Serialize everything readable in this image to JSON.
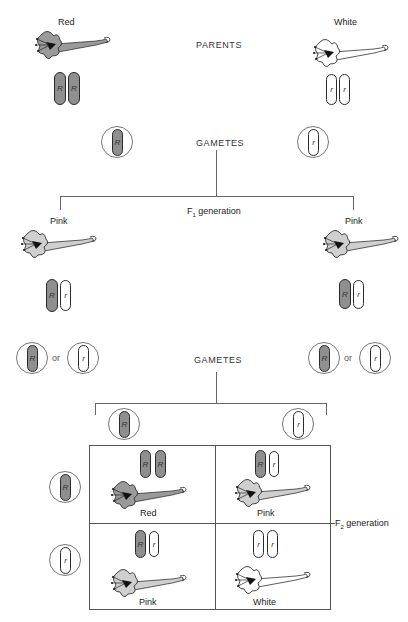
{
  "diagram": {
    "colors": {
      "dominant_allele_fill": "#8f8f8f",
      "recessive_allele_fill": "#ffffff",
      "outline": "#2a2a2a",
      "line": "#666666"
    },
    "parents": {
      "heading": "PARENTS",
      "left": {
        "phenotype": "Red",
        "alleles": [
          "R",
          "R"
        ]
      },
      "right": {
        "phenotype": "White",
        "alleles": [
          "r",
          "r"
        ]
      }
    },
    "parent_gametes": {
      "heading": "GAMETES",
      "left": {
        "allele": "R"
      },
      "right": {
        "allele": "r"
      }
    },
    "f1": {
      "heading_prefix": "F",
      "heading_sub": "1",
      "heading_suffix": " generation",
      "left": {
        "phenotype": "Pink",
        "alleles": [
          "R",
          "r"
        ]
      },
      "right": {
        "phenotype": "Pink",
        "alleles": [
          "R",
          "r"
        ]
      }
    },
    "f1_gametes": {
      "heading": "GAMETES",
      "connector": "or",
      "left": [
        "R",
        "r"
      ],
      "right": [
        "R",
        "r"
      ]
    },
    "f2": {
      "label_prefix": "F",
      "label_sub": "2",
      "label_suffix": " generation",
      "top_gametes": [
        "R",
        "r"
      ],
      "side_gametes": [
        "R",
        "r"
      ],
      "cells": [
        {
          "alleles": [
            "R",
            "R"
          ],
          "phenotype": "Red"
        },
        {
          "alleles": [
            "R",
            "r"
          ],
          "phenotype": "Pink"
        },
        {
          "alleles": [
            "R",
            "r"
          ],
          "phenotype": "Pink"
        },
        {
          "alleles": [
            "r",
            "r"
          ],
          "phenotype": "White"
        }
      ]
    }
  }
}
